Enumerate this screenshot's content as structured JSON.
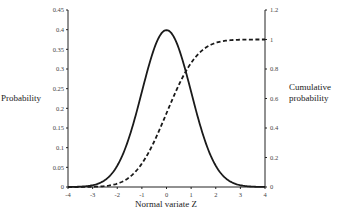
{
  "chart_data": {
    "type": "line",
    "title": "",
    "xlabel": "Normal variate Z",
    "ylabel": "Probability",
    "y2label": "Cumulative probability",
    "y2label_lines": [
      "Cumulative",
      "probability"
    ],
    "xlim": [
      -4,
      4
    ],
    "ylim": [
      0,
      0.45
    ],
    "y2lim": [
      0,
      1.2
    ],
    "grid": false,
    "legend": "none",
    "x_ticks": [
      "-4",
      "-3",
      "-2",
      "-1",
      "0",
      "1",
      "2",
      "3",
      "4"
    ],
    "y_ticks": [
      "0",
      "0.05",
      "0.1",
      "0.15",
      "0.2",
      "0.25",
      "0.3",
      "0.35",
      "0.4",
      "0.45"
    ],
    "y2_ticks": [
      "0",
      "0.2",
      "0.4",
      "0.6",
      "0.8",
      "1",
      "1.2"
    ],
    "series": [
      {
        "name": "Probability density (left axis)",
        "style": "solid",
        "axis": "left",
        "x": [
          -4,
          -3.5,
          -3,
          -2.5,
          -2,
          -1.5,
          -1,
          -0.5,
          0,
          0.5,
          1,
          1.5,
          2,
          2.5,
          3,
          3.5,
          4
        ],
        "values": [
          0.0001,
          0.0009,
          0.0044,
          0.0175,
          0.054,
          0.1295,
          0.242,
          0.352,
          0.399,
          0.352,
          0.242,
          0.1295,
          0.054,
          0.0175,
          0.0044,
          0.0009,
          0.0001
        ]
      },
      {
        "name": "Cumulative probability (right axis)",
        "style": "dashed",
        "axis": "right",
        "x": [
          -4,
          -3.5,
          -3,
          -2.5,
          -2,
          -1.5,
          -1,
          -0.5,
          0,
          0.5,
          1,
          1.5,
          2,
          2.5,
          3,
          3.5,
          4
        ],
        "values": [
          0.0,
          0.0002,
          0.0013,
          0.0062,
          0.0228,
          0.0668,
          0.1587,
          0.3085,
          0.5,
          0.6915,
          0.8413,
          0.9332,
          0.9772,
          0.9938,
          0.9987,
          0.9998,
          1.0
        ]
      }
    ]
  }
}
